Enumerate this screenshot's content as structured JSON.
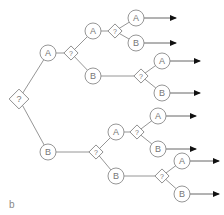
{
  "panel_label": "b",
  "colors": {
    "stroke": "#8a8a8a",
    "text": "#777777",
    "arrowhead": "#111111",
    "background": "#ffffff"
  },
  "nodes": {
    "root": {
      "type": "decision",
      "label": "?"
    },
    "a1": {
      "type": "state",
      "label": "A"
    },
    "b1": {
      "type": "state",
      "label": "B"
    },
    "d_a1": {
      "type": "decision",
      "label": "?"
    },
    "a1a": {
      "type": "state",
      "label": "A"
    },
    "a1b": {
      "type": "state",
      "label": "B"
    },
    "d_a1a": {
      "type": "decision",
      "label": "?"
    },
    "a1aa": {
      "type": "state",
      "label": "A"
    },
    "a1ab": {
      "type": "state",
      "label": "B"
    },
    "d_a1b": {
      "type": "decision",
      "label": "?"
    },
    "a1ba": {
      "type": "state",
      "label": "A"
    },
    "a1bb": {
      "type": "state",
      "label": "B"
    },
    "d_b1": {
      "type": "decision",
      "label": "?"
    },
    "b1a": {
      "type": "state",
      "label": "A"
    },
    "b1b": {
      "type": "state",
      "label": "B"
    },
    "d_b1a": {
      "type": "decision",
      "label": "?"
    },
    "b1aa": {
      "type": "state",
      "label": "A"
    },
    "b1ab": {
      "type": "state",
      "label": "B"
    },
    "d_b1b": {
      "type": "decision",
      "label": "?"
    },
    "b1ba": {
      "type": "state",
      "label": "A"
    },
    "b1bb": {
      "type": "state",
      "label": "B"
    }
  },
  "leaf_arrows": 8
}
